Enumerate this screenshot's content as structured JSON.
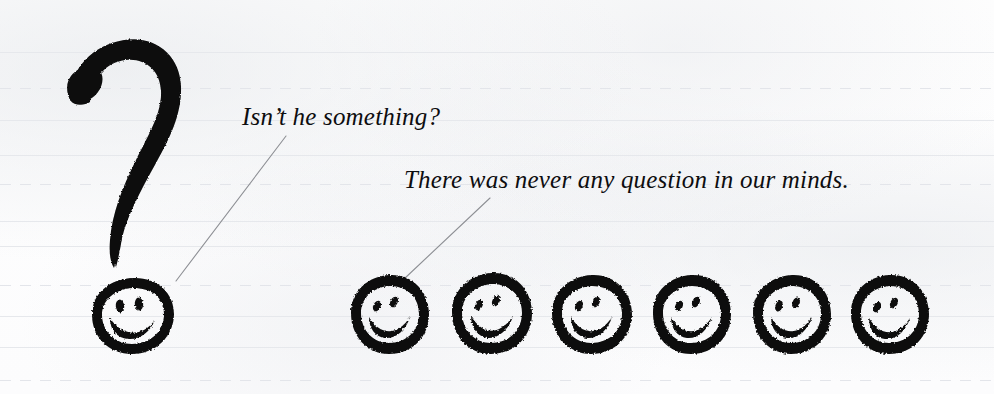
{
  "canvas": {
    "width": 994,
    "height": 394,
    "background_color": "#fdfdfd"
  },
  "paper": {
    "style": "ruled-notebook-paper",
    "rule_color_solid": "#e6e8ec",
    "rule_color_dashed": "#e3e5ea",
    "rules": [
      {
        "y": 52,
        "style": "solid"
      },
      {
        "y": 88,
        "style": "dashed"
      },
      {
        "y": 120,
        "style": "solid"
      },
      {
        "y": 155,
        "style": "solid"
      },
      {
        "y": 184,
        "style": "dashed"
      },
      {
        "y": 221,
        "style": "solid"
      },
      {
        "y": 246,
        "style": "solid"
      },
      {
        "y": 285,
        "style": "dashed"
      },
      {
        "y": 316,
        "style": "solid"
      },
      {
        "y": 347,
        "style": "solid"
      },
      {
        "y": 380,
        "style": "dashed"
      }
    ]
  },
  "captions": [
    {
      "id": "caption-1",
      "text": "Isn’t he something?",
      "x": 242,
      "y": 103,
      "font_size": 25,
      "style": "italic-serif",
      "color": "#0d0d0f"
    },
    {
      "id": "caption-2",
      "text": "There was never any question in our minds.",
      "x": 404,
      "y": 166,
      "font_size": 25,
      "style": "italic-serif",
      "color": "#0d0d0f"
    }
  ],
  "leader_lines": [
    {
      "id": "leader-1",
      "from_x": 286,
      "from_y": 136,
      "to_x": 176,
      "to_y": 281,
      "color": "#8d8f94",
      "width": 1.1
    },
    {
      "id": "leader-2",
      "from_x": 490,
      "from_y": 198,
      "to_x": 404,
      "to_y": 279,
      "color": "#8d8f94",
      "width": 1.1
    }
  ],
  "question_mark": {
    "label": "hand-drawn brush question mark",
    "color": "#0a0a0a",
    "bbox": {
      "x": 63,
      "y": 38,
      "width": 120,
      "height": 230
    }
  },
  "smileys": {
    "ink_color": "#0a0a0a",
    "large": [
      {
        "id": "smiley-large",
        "cx": 133,
        "cy": 316,
        "rx": 40,
        "ry": 38,
        "role": "question-mark-dot",
        "eyes": "upright-ovals",
        "mouth": "wide-crescent-grin"
      }
    ],
    "row": [
      {
        "id": "smiley-row-1",
        "cx": 390,
        "cy": 314,
        "rx": 39,
        "ry": 40,
        "eyes": "slanted-ovals",
        "mouth": "crescent-grin"
      },
      {
        "id": "smiley-row-2",
        "cx": 492,
        "cy": 313,
        "rx": 40,
        "ry": 41,
        "eyes": "slanted-ovals",
        "mouth": "crescent-grin"
      },
      {
        "id": "smiley-row-3",
        "cx": 592,
        "cy": 314,
        "rx": 40,
        "ry": 40,
        "eyes": "slanted-ovals",
        "mouth": "crescent-grin"
      },
      {
        "id": "smiley-row-4",
        "cx": 692,
        "cy": 314,
        "rx": 39,
        "ry": 40,
        "eyes": "slanted-ovals",
        "mouth": "crescent-grin"
      },
      {
        "id": "smiley-row-5",
        "cx": 792,
        "cy": 314,
        "rx": 39,
        "ry": 40,
        "eyes": "slanted-ovals",
        "mouth": "crescent-grin"
      },
      {
        "id": "smiley-row-6",
        "cx": 890,
        "cy": 314,
        "rx": 39,
        "ry": 40,
        "eyes": "slanted-ovals",
        "mouth": "crescent-grin"
      }
    ],
    "row_count": 6,
    "total_count": 7
  }
}
